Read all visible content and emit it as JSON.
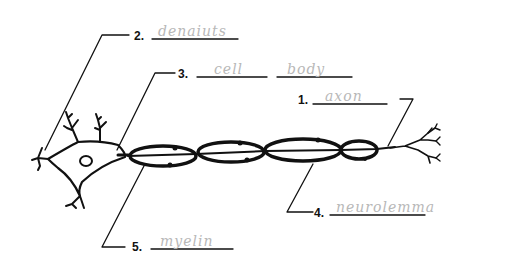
{
  "diagram": {
    "type": "neuron-labeling-worksheet",
    "labels": [
      {
        "number": "1.",
        "answer": "axon"
      },
      {
        "number": "2.",
        "answer": "denaiuts"
      },
      {
        "number": "3.",
        "answer": "cell",
        "answer2": "body"
      },
      {
        "number": "4.",
        "answer": "neurolemma"
      },
      {
        "number": "5.",
        "answer": "myelin"
      }
    ],
    "parts": [
      "dendrites",
      "cell body",
      "nucleus",
      "myelin sheath segments",
      "axon",
      "axon terminals"
    ],
    "colors": {
      "ink": "#111111",
      "handwriting": "#b8b8b8",
      "background": "#ffffff"
    }
  }
}
